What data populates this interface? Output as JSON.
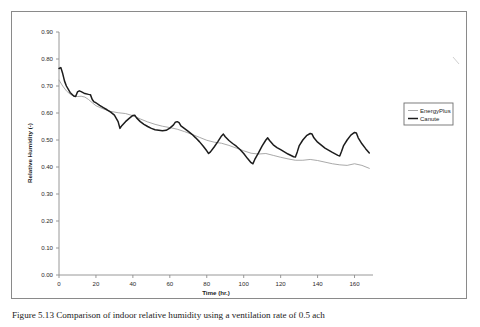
{
  "figure": {
    "caption": "Figure 5.13 Comparison of indoor relative humidity using a ventilation rate of 0.5 ach"
  },
  "chart_data": {
    "type": "line",
    "title": "",
    "xlabel": "Time (hr.)",
    "ylabel": "Relative Humidity (-)",
    "xlim": [
      0,
      170
    ],
    "ylim": [
      0.0,
      0.9
    ],
    "xticks": [
      0,
      20,
      40,
      60,
      80,
      100,
      120,
      140,
      160
    ],
    "yticks": [
      0.0,
      0.1,
      0.2,
      0.3,
      0.4,
      0.5,
      0.6,
      0.7,
      0.8,
      0.9
    ],
    "xticklabels": [
      "0",
      "20",
      "40",
      "60",
      "80",
      "100",
      "120",
      "140",
      "160"
    ],
    "yticklabels": [
      "0.00",
      "0.10",
      "0.20",
      "0.30",
      "0.40",
      "0.50",
      "0.60",
      "0.70",
      "0.80",
      "0.90"
    ],
    "grid": false,
    "legend_position": "right-outside",
    "colors": {
      "EnergyPlus": "#9a9a9a",
      "Canute": "#1c1c1c"
    },
    "series": [
      {
        "name": "EnergyPlus",
        "x": [
          0,
          2,
          4,
          6,
          8,
          10,
          12,
          14,
          16,
          18,
          20,
          24,
          28,
          32,
          36,
          40,
          44,
          48,
          52,
          56,
          60,
          64,
          68,
          72,
          76,
          80,
          84,
          88,
          92,
          96,
          100,
          104,
          108,
          112,
          116,
          120,
          124,
          128,
          132,
          136,
          140,
          144,
          148,
          152,
          156,
          160,
          164,
          168
        ],
        "values": [
          0.722,
          0.7,
          0.682,
          0.67,
          0.662,
          0.661,
          0.662,
          0.659,
          0.65,
          0.638,
          0.627,
          0.615,
          0.606,
          0.601,
          0.598,
          0.59,
          0.578,
          0.567,
          0.558,
          0.551,
          0.546,
          0.54,
          0.531,
          0.521,
          0.51,
          0.499,
          0.492,
          0.488,
          0.48,
          0.47,
          0.46,
          0.451,
          0.448,
          0.45,
          0.443,
          0.436,
          0.43,
          0.425,
          0.425,
          0.428,
          0.424,
          0.418,
          0.412,
          0.408,
          0.406,
          0.412,
          0.406,
          0.395
        ]
      },
      {
        "name": "Canute",
        "x": [
          0,
          1,
          2,
          3,
          4,
          6,
          8,
          9,
          10,
          11,
          12,
          14,
          16,
          17,
          18,
          19,
          20,
          22,
          24,
          26,
          28,
          30,
          32,
          33,
          34,
          36,
          38,
          40,
          41,
          42,
          44,
          46,
          48,
          50,
          52,
          54,
          56,
          58,
          60,
          62,
          63,
          64,
          65,
          66,
          68,
          70,
          72,
          74,
          76,
          78,
          80,
          81,
          82,
          84,
          86,
          88,
          89,
          90,
          92,
          94,
          96,
          98,
          100,
          102,
          104,
          105,
          106,
          108,
          110,
          112,
          113,
          114,
          116,
          118,
          120,
          124,
          127,
          128,
          129,
          130,
          132,
          134,
          136,
          137,
          138,
          140,
          144,
          148,
          151,
          152,
          153,
          154,
          156,
          158,
          160,
          161,
          162,
          164,
          166,
          168
        ],
        "values": [
          0.765,
          0.768,
          0.746,
          0.718,
          0.7,
          0.676,
          0.663,
          0.661,
          0.678,
          0.682,
          0.679,
          0.672,
          0.669,
          0.668,
          0.65,
          0.641,
          0.638,
          0.628,
          0.62,
          0.612,
          0.603,
          0.592,
          0.568,
          0.543,
          0.553,
          0.568,
          0.58,
          0.591,
          0.592,
          0.582,
          0.568,
          0.558,
          0.55,
          0.543,
          0.538,
          0.536,
          0.534,
          0.536,
          0.544,
          0.556,
          0.566,
          0.568,
          0.564,
          0.552,
          0.542,
          0.532,
          0.521,
          0.508,
          0.494,
          0.478,
          0.46,
          0.45,
          0.456,
          0.474,
          0.494,
          0.515,
          0.522,
          0.512,
          0.498,
          0.487,
          0.477,
          0.465,
          0.45,
          0.432,
          0.416,
          0.412,
          0.428,
          0.452,
          0.478,
          0.5,
          0.508,
          0.498,
          0.482,
          0.472,
          0.464,
          0.448,
          0.438,
          0.437,
          0.456,
          0.478,
          0.5,
          0.516,
          0.524,
          0.522,
          0.508,
          0.492,
          0.47,
          0.454,
          0.443,
          0.441,
          0.458,
          0.478,
          0.5,
          0.518,
          0.528,
          0.526,
          0.508,
          0.486,
          0.468,
          0.452
        ]
      }
    ]
  },
  "legend": {
    "entries": [
      {
        "label": "EnergyPlus"
      },
      {
        "label": "Canute"
      }
    ]
  }
}
